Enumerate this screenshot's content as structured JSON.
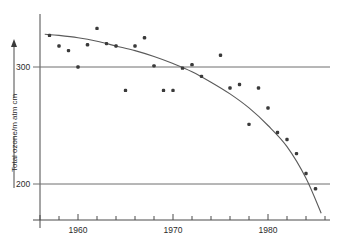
{
  "chart_data": {
    "type": "scatter",
    "title": "",
    "subtitle": "",
    "xlabel": "",
    "ylabel": "Total ozone/m atm cm",
    "xlim": [
      1956,
      1987
    ],
    "ylim": [
      160,
      340
    ],
    "grid": "horizontal gridlines at y = 300 and y = 200 only",
    "legend": "none",
    "x_tick_labels": [
      "1960",
      "1970",
      "1980"
    ],
    "x_tick_values": [
      1960,
      1970,
      1980
    ],
    "x_minor_tick_interval": 2,
    "y_tick_labels": [
      "300",
      "200"
    ],
    "y_tick_values": [
      300,
      200
    ],
    "axis_arrow": "up-arrow on y-axis label leader line",
    "point_marker": "filled-square",
    "series": [
      {
        "name": "October mean total ozone, Halley Bay",
        "x": [
          1957,
          1958,
          1959,
          1960,
          1961,
          1962,
          1963,
          1964,
          1965,
          1966,
          1967,
          1968,
          1969,
          1970,
          1971,
          1972,
          1973,
          1975,
          1976,
          1977,
          1978,
          1979,
          1980,
          1981,
          1982,
          1983,
          1984,
          1985
        ],
        "values": [
          327,
          318,
          314,
          300,
          319,
          333,
          320,
          318,
          280,
          318,
          325,
          301,
          280,
          280,
          299,
          302,
          292,
          310,
          282,
          285,
          251,
          282,
          265,
          244,
          238,
          226,
          209,
          196
        ]
      }
    ],
    "fit_curve": {
      "name": "fitted decline curve",
      "x": [
        1956.5,
        1958,
        1960,
        1962,
        1964,
        1966,
        1968,
        1970,
        1972,
        1974,
        1976,
        1978,
        1980,
        1982,
        1984,
        1985.6
      ],
      "values": [
        328,
        327,
        325,
        322,
        318,
        314,
        309,
        303,
        296,
        287,
        277,
        265,
        250,
        232,
        205,
        175
      ]
    },
    "colors": {
      "point": "#3a3a3a",
      "curve": "#5a5a5a",
      "axis": "#4a4a4a",
      "grid": "#6e6e6e",
      "background": "#ffffff"
    }
  }
}
